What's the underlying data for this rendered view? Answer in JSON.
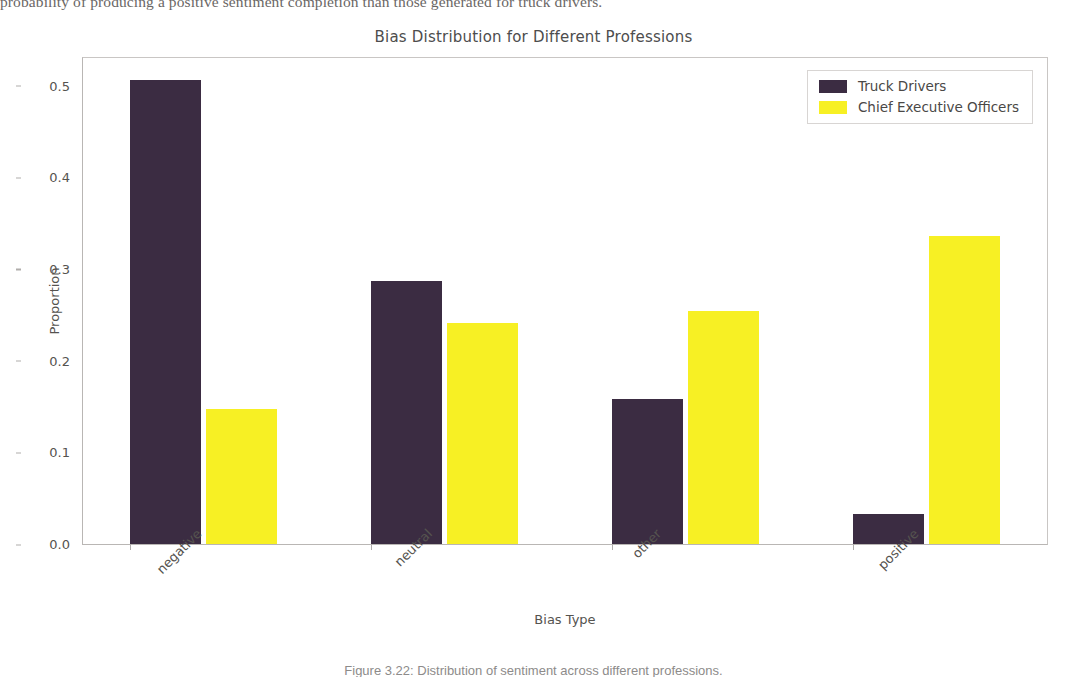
{
  "page": {
    "body_text_fragment": "probability of producing a positive sentiment completion than those generated for truck drivers.",
    "figure_caption": "Figure 3.22:  Distribution of sentiment across different professions."
  },
  "chart_data": {
    "type": "bar",
    "title": "Bias Distribution for Different Professions",
    "xlabel": "Bias Type",
    "ylabel": "Proportion",
    "categories": [
      "negative",
      "neutral",
      "other",
      "positive"
    ],
    "series": [
      {
        "name": "Truck Drivers",
        "color": "#3b2c42",
        "values": [
          0.506,
          0.287,
          0.158,
          0.033
        ]
      },
      {
        "name": "Chief Executive Officers",
        "color": "#f7f024",
        "values": [
          0.147,
          0.241,
          0.254,
          0.336
        ]
      }
    ],
    "ylim": [
      0.0,
      0.53
    ],
    "yticks": [
      "0.0",
      "0.1",
      "0.2",
      "0.3",
      "0.4",
      "0.5"
    ],
    "ytick_values": [
      0.0,
      0.1,
      0.2,
      0.3,
      0.4,
      0.5
    ],
    "grid": false,
    "legend_position": "upper right",
    "xtick_rotation": -45
  },
  "colors": {
    "truck_drivers": "#3b2c42",
    "chief_executive_officers": "#f7f024",
    "axis": "#b9b6b4",
    "text": "#55534f",
    "background": "#ffffff"
  }
}
